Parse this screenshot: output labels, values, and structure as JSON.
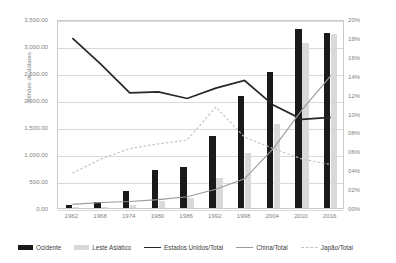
{
  "chart_data": {
    "type": "bar",
    "title": "",
    "xlabel": "",
    "ylabel": "Bilhões de dólares",
    "y2label": "",
    "categories": [
      "1962",
      "1968",
      "1974",
      "1980",
      "1986",
      "1992",
      "1998",
      "2004",
      "2010",
      "2016"
    ],
    "ylim": [
      0,
      3500
    ],
    "y2lim": [
      0,
      20
    ],
    "yticks": [
      "0.00",
      "500.00",
      "1,000.00",
      "1,500.00",
      "2,000.00",
      "2,500.00",
      "3,000.00",
      "3,500.00"
    ],
    "y2ticks": [
      "00%",
      "02%",
      "04%",
      "06%",
      "08%",
      "10%",
      "12%",
      "14%",
      "16%",
      "18%",
      "20%"
    ],
    "grid": true,
    "legend_position": "bottom",
    "bar_series": [
      {
        "name": "Ocidente",
        "color": "#1a1a1a",
        "axis": "left",
        "values": [
          60,
          120,
          310,
          700,
          760,
          1330,
          2080,
          2520,
          3310,
          3240
        ]
      },
      {
        "name": "Leste Asiático",
        "color": "#d9d9d9",
        "axis": "left",
        "values": [
          10,
          25,
          60,
          130,
          190,
          560,
          1010,
          1560,
          3060,
          3230
        ]
      }
    ],
    "line_series": [
      {
        "name": "Estados Unidos/Total",
        "color": "#262626",
        "style": "solid",
        "axis": "right",
        "values": [
          18.2,
          15.4,
          12.4,
          12.5,
          11.8,
          12.9,
          13.7,
          11.1,
          9.6,
          9.8
        ]
      },
      {
        "name": "China/Total",
        "color": "#999999",
        "style": "solid",
        "axis": "right",
        "values": [
          0.6,
          0.8,
          0.9,
          1.1,
          1.4,
          2.2,
          3.3,
          6.5,
          10.6,
          14.2
        ]
      },
      {
        "name": "Japão/Total",
        "color": "#c2c2c2",
        "style": "dotted",
        "axis": "right",
        "values": [
          3.9,
          5.4,
          6.5,
          7.0,
          7.4,
          10.9,
          7.7,
          6.5,
          5.4,
          4.8
        ]
      }
    ]
  }
}
